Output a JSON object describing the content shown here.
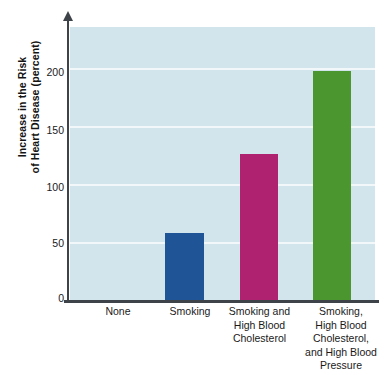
{
  "chart_data": {
    "type": "bar",
    "title": "",
    "subtitle": "",
    "xlabel": "",
    "ylabel": "Increase in the Risk of Heart Disease (percent)",
    "ylabel_lines": [
      "Increase in the Risk",
      "of Heart Disease (percent)"
    ],
    "categories": [
      "None",
      "Smoking",
      "Smoking and High Blood Cholesterol",
      "Smoking, High Blood Cholesterol, and High Blood Pressure"
    ],
    "category_lines": [
      [
        "None"
      ],
      [
        "Smoking"
      ],
      [
        "Smoking and",
        "High Blood",
        "Cholesterol"
      ],
      [
        "Smoking,",
        "High Blood",
        "Cholesterol,",
        "and High Blood",
        "Pressure"
      ]
    ],
    "values": [
      0,
      58,
      126,
      197
    ],
    "ylim": [
      0,
      235
    ],
    "yticks": [
      0,
      50,
      100,
      150,
      200
    ],
    "ytick_labels": [
      "0",
      "50",
      "100",
      "150",
      "200"
    ],
    "grid": true,
    "grid_axis": "y",
    "legend": "none",
    "bar_colors": [
      "none",
      "#1f5596",
      "#ae2270",
      "#4b962e"
    ],
    "plot_background": "#d3e5ec",
    "gridline_color": "#f2f8fa",
    "axis_color": "#3d4348",
    "page_background": "#ffffff"
  }
}
